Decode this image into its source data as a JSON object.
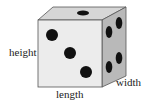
{
  "diagram": {
    "labels": {
      "height": "height",
      "length": "length",
      "width": "width"
    },
    "faces": {
      "front": {
        "pips": 3,
        "color": "#ececec"
      },
      "top": {
        "pips": 1,
        "color": "#d6d6d6"
      },
      "right": {
        "pips": 4,
        "color": "#b9b9b9"
      }
    },
    "pip_color": "#111111",
    "edge_color": "#555555"
  }
}
